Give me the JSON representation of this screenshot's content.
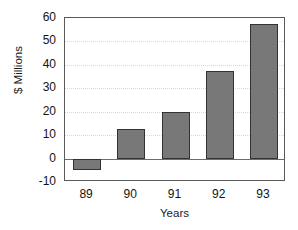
{
  "chart_data": {
    "type": "bar",
    "title": "",
    "xlabel": "Years",
    "ylabel": "$ Millions",
    "categories": [
      "89",
      "90",
      "91",
      "92",
      "93"
    ],
    "values": [
      -5,
      12.5,
      20,
      37.5,
      57.5
    ],
    "ylim": [
      -10,
      60
    ],
    "yticks": [
      -10,
      0,
      10,
      20,
      30,
      40,
      50,
      60
    ],
    "ytick_labels": [
      "-10",
      "0",
      "10",
      "20",
      "30",
      "40",
      "50",
      "60"
    ],
    "grid": "horizontal-dotted",
    "legend": "none",
    "series": [
      {
        "name": "$ Millions",
        "values": [
          -5,
          12.5,
          20,
          37.5,
          57.5
        ]
      }
    ],
    "colors": {
      "bar_fill": "#787878",
      "bar_border": "#333333",
      "axis": "#5a5a5a",
      "gridline": "#d8d8d8",
      "zeroline": "#6d6d6d",
      "text": "#141414",
      "background": "#ffffff"
    }
  }
}
